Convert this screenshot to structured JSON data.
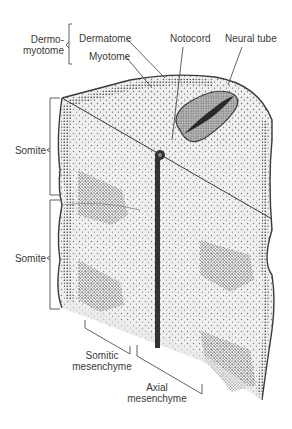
{
  "diagram": {
    "colors": {
      "outline": "#3a3a3a",
      "fill": "#efefef",
      "stipple": "#6a6a6a",
      "dense_stipple": "#555555",
      "neural_tube_fill": "#9a9a9a",
      "neural_tube_lumen": "#2a2a2a",
      "notocord": "#333333",
      "text": "#3a3a3a"
    }
  },
  "labels": {
    "dermomyotome_line1": "Dermo-",
    "dermomyotome_line2": "myotome",
    "dermatome": "Dermatome",
    "myotome": "Myotome",
    "notocord": "Notocord",
    "neural_tube": "Neural tube",
    "somite_upper": "Somite",
    "somite_lower": "Somite",
    "somitic_mesenchyme_line1": "Somitic",
    "somitic_mesenchyme_line2": "mesenchyme",
    "axial_mesenchyme_line1": "Axial",
    "axial_mesenchyme_line2": "mesenchyme"
  }
}
